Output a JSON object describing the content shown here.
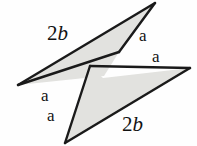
{
  "figure": {
    "type": "geometry-diagram",
    "width": 197,
    "height": 146,
    "background_color": "#fefefe",
    "fill_color": "#e2e2df",
    "stroke_color": "#1a1a1a",
    "text_color": "#121212",
    "shapes": [
      {
        "name": "upper-triangle",
        "points": "18,85 155,3 120,53"
      },
      {
        "name": "lower-triangle",
        "points": "190,68 65,143 86,62"
      }
    ],
    "labels": [
      {
        "name": "label-2b-top",
        "text_number": "2",
        "text_variable": "b",
        "x": 47,
        "y": 23
      },
      {
        "name": "label-a-top",
        "text": "a",
        "x": 139,
        "y": 27
      },
      {
        "name": "label-a-right",
        "text": "a",
        "x": 152,
        "y": 48
      },
      {
        "name": "label-a-left",
        "text": "a",
        "x": 41,
        "y": 87
      },
      {
        "name": "label-a-bottom",
        "text": "a",
        "x": 47,
        "y": 107
      },
      {
        "name": "label-2b-bottom",
        "text_number": "2",
        "text_variable": "b",
        "x": 122,
        "y": 114
      }
    ]
  }
}
